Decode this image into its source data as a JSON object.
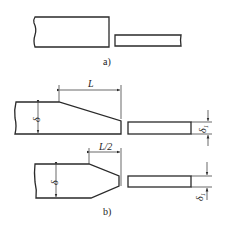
{
  "figure": {
    "subfigures": [
      {
        "id": "a",
        "caption": "a)"
      },
      {
        "id": "b",
        "caption": "b)",
        "dimensions": {
          "top_taper_length": "L",
          "double_taper_length": "L/2",
          "thick_plate_thickness": "δ",
          "thin_plate_thickness": "δ1"
        }
      }
    ],
    "colors": {
      "line": "#2a2a2a",
      "background": "#ffffff"
    }
  }
}
